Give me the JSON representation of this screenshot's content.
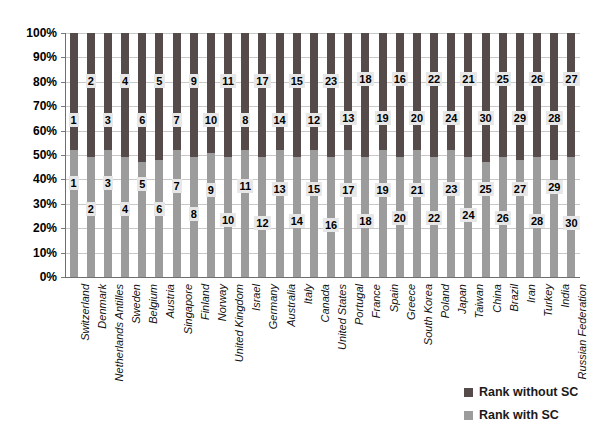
{
  "chart_data": {
    "type": "bar",
    "stacked": true,
    "stacked_total_pct": 100,
    "title": "",
    "xlabel": "",
    "ylabel": "",
    "ylim": [
      0,
      100
    ],
    "y_tick_step_pct": 10,
    "y_tick_suffix": "%",
    "grid": true,
    "legend_position": "bottom-right",
    "categories": [
      "Switzerland",
      "Denmark",
      "Netherlands Antilles",
      "Sweden",
      "Belgium",
      "Austria",
      "Singapore",
      "Finland",
      "Norway",
      "United Kingdom",
      "Israel",
      "Germany",
      "Australia",
      "Italy",
      "Canada",
      "United States",
      "Portugal",
      "France",
      "Spain",
      "Greece",
      "South Korea",
      "Poland",
      "Japan",
      "Taiwan",
      "China",
      "Brazil",
      "Iran",
      "Turkey",
      "India",
      "Russian Federation"
    ],
    "series": [
      {
        "name": "Rank without SC",
        "color": "#554b4a",
        "values": [
          1,
          2,
          3,
          4,
          6,
          5,
          7,
          9,
          10,
          11,
          8,
          17,
          14,
          15,
          12,
          23,
          13,
          18,
          19,
          16,
          20,
          22,
          24,
          21,
          30,
          25,
          29,
          26,
          28,
          27
        ]
      },
      {
        "name": "Rank with SC",
        "color": "#9c9c9c",
        "values": [
          1,
          2,
          3,
          4,
          5,
          6,
          7,
          8,
          9,
          10,
          11,
          12,
          13,
          14,
          15,
          16,
          17,
          18,
          19,
          20,
          21,
          22,
          23,
          24,
          25,
          26,
          27,
          28,
          29,
          30
        ]
      }
    ],
    "gray_segment_top_pct": [
      52,
      49,
      52,
      49,
      47,
      48,
      52,
      49,
      51,
      49,
      52,
      49,
      52,
      49,
      52,
      49,
      52,
      49,
      52,
      49,
      52,
      49,
      52,
      49,
      47,
      49,
      48,
      49,
      48,
      49
    ],
    "label_y_without_pct": [
      64.5,
      80.5,
      64.5,
      80.5,
      64.5,
      80.5,
      64.5,
      80.5,
      64.5,
      80.5,
      64.5,
      80.5,
      64.5,
      80.5,
      64.5,
      80.5,
      65,
      81,
      65,
      81,
      65,
      81,
      65,
      81,
      65,
      81,
      65,
      81,
      65,
      81
    ],
    "label_y_with_pct": [
      38.5,
      28,
      38.5,
      28,
      38,
      28,
      37.5,
      26,
      35.5,
      23.5,
      37.5,
      22,
      36,
      23,
      36,
      21.5,
      35.5,
      23,
      35.5,
      24,
      35.5,
      24,
      36,
      25.5,
      36,
      24,
      36,
      23,
      37,
      22
    ]
  },
  "legend": {
    "items": [
      {
        "label": "Rank without SC",
        "color": "#554b4a"
      },
      {
        "label": "Rank with SC",
        "color": "#9c9c9c"
      }
    ]
  },
  "colors": {
    "background": "#ffffff",
    "gridline": "#c9c9c9",
    "axis": "#6f6f6f",
    "rank_label_box": "#e7e7e7",
    "text": "#000000"
  }
}
